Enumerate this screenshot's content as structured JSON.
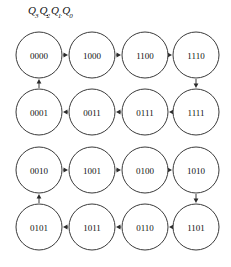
{
  "header": {
    "symbol": "Q",
    "subscripts": [
      "3",
      "2",
      "1",
      "0"
    ],
    "full_text": "Q3Q2Q1Q0"
  },
  "diagram": {
    "type": "state-transition-graph",
    "node_shape": "circle",
    "edge_style": "solid-arrow",
    "colors": {
      "background": "#ffffff",
      "node_fill": "#ffffff",
      "node_stroke": "#3a3a3a",
      "edge": "#3a3a3a",
      "text": "#111111"
    },
    "groups": [
      {
        "name": "upper-cycle",
        "rows": [
          {
            "name": "row-1",
            "direction": "left-to-right",
            "nodes": [
              "0000",
              "1000",
              "1100",
              "1110"
            ]
          },
          {
            "name": "row-2",
            "direction": "right-to-left",
            "nodes": [
              "1111",
              "0111",
              "0011",
              "0001"
            ]
          }
        ],
        "cycle_order": [
          "0000",
          "1000",
          "1100",
          "1110",
          "1111",
          "0111",
          "0011",
          "0001"
        ]
      },
      {
        "name": "lower-cycle",
        "rows": [
          {
            "name": "row-3",
            "direction": "left-to-right",
            "nodes": [
              "0010",
              "1001",
              "0100",
              "1010"
            ]
          },
          {
            "name": "row-4",
            "direction": "right-to-left",
            "nodes": [
              "1101",
              "0110",
              "1011",
              "0101"
            ]
          }
        ],
        "cycle_order": [
          "0010",
          "1001",
          "0100",
          "1010",
          "1101",
          "0110",
          "1011",
          "0101"
        ]
      }
    ],
    "nodes": [
      {
        "id": "n00",
        "label": "0000",
        "cx": 39,
        "cy": 55,
        "r": 23
      },
      {
        "id": "n01",
        "label": "1000",
        "cx": 92,
        "cy": 55,
        "r": 23
      },
      {
        "id": "n02",
        "label": "1100",
        "cx": 145,
        "cy": 55,
        "r": 23
      },
      {
        "id": "n03",
        "label": "1110",
        "cx": 196,
        "cy": 55,
        "r": 23
      },
      {
        "id": "n10",
        "label": "0001",
        "cx": 39,
        "cy": 112,
        "r": 23
      },
      {
        "id": "n11",
        "label": "0011",
        "cx": 92,
        "cy": 112,
        "r": 23
      },
      {
        "id": "n12",
        "label": "0111",
        "cx": 145,
        "cy": 112,
        "r": 23
      },
      {
        "id": "n13",
        "label": "1111",
        "cx": 196,
        "cy": 112,
        "r": 23
      },
      {
        "id": "n20",
        "label": "0010",
        "cx": 39,
        "cy": 170,
        "r": 23
      },
      {
        "id": "n21",
        "label": "1001",
        "cx": 92,
        "cy": 170,
        "r": 23
      },
      {
        "id": "n22",
        "label": "0100",
        "cx": 145,
        "cy": 170,
        "r": 23
      },
      {
        "id": "n23",
        "label": "1010",
        "cx": 196,
        "cy": 170,
        "r": 23
      },
      {
        "id": "n30",
        "label": "0101",
        "cx": 39,
        "cy": 227,
        "r": 23
      },
      {
        "id": "n31",
        "label": "1011",
        "cx": 92,
        "cy": 227,
        "r": 23
      },
      {
        "id": "n32",
        "label": "0110",
        "cx": 145,
        "cy": 227,
        "r": 23
      },
      {
        "id": "n33",
        "label": "1101",
        "cx": 196,
        "cy": 227,
        "r": 23
      }
    ],
    "edges": [
      {
        "from": "0000",
        "to": "1000",
        "orientation": "horizontal-right"
      },
      {
        "from": "1000",
        "to": "1100",
        "orientation": "horizontal-right"
      },
      {
        "from": "1100",
        "to": "1110",
        "orientation": "horizontal-right"
      },
      {
        "from": "1110",
        "to": "1111",
        "orientation": "vertical-down"
      },
      {
        "from": "1111",
        "to": "0111",
        "orientation": "horizontal-left"
      },
      {
        "from": "0111",
        "to": "0011",
        "orientation": "horizontal-left"
      },
      {
        "from": "0011",
        "to": "0001",
        "orientation": "horizontal-left"
      },
      {
        "from": "0001",
        "to": "0000",
        "orientation": "vertical-up"
      },
      {
        "from": "0010",
        "to": "1001",
        "orientation": "horizontal-right"
      },
      {
        "from": "1001",
        "to": "0100",
        "orientation": "horizontal-right"
      },
      {
        "from": "0100",
        "to": "1010",
        "orientation": "horizontal-right"
      },
      {
        "from": "1010",
        "to": "1101",
        "orientation": "vertical-down"
      },
      {
        "from": "1101",
        "to": "0110",
        "orientation": "horizontal-left"
      },
      {
        "from": "0110",
        "to": "1011",
        "orientation": "horizontal-left"
      },
      {
        "from": "1011",
        "to": "0101",
        "orientation": "horizontal-left"
      },
      {
        "from": "0101",
        "to": "0010",
        "orientation": "vertical-up"
      }
    ]
  }
}
